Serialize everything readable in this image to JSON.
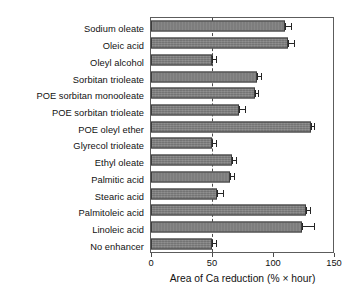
{
  "chart_data": {
    "type": "bar",
    "orientation": "horizontal",
    "title": "",
    "subtitle": "",
    "xlabel": "Area of Ca reduction (% × hour)",
    "ylabel": "",
    "xlim": [
      0,
      150
    ],
    "xticks": [
      0,
      50,
      100,
      150
    ],
    "xticklabels": [
      "0",
      "50",
      "100",
      "150"
    ],
    "grid": false,
    "legend": null,
    "reference_line": {
      "value": 50,
      "style": "dashed",
      "orientation": "vertical"
    },
    "categories": [
      "Sodium oleate",
      "Oleic acid",
      "Oleyl alcohol",
      "Sorbitan trioleate",
      "POE sorbitan monooleate",
      "POE sorbitan trioleate",
      "POE oleyl ether",
      "Glyrecol trioleate",
      "Ethyl oleate",
      "Palmitic acid",
      "Stearic acid",
      "Palmitoleic acid",
      "Linoleic acid",
      "No enhancer"
    ],
    "values": [
      110,
      112,
      50,
      87,
      85,
      72,
      131,
      50,
      66,
      65,
      54,
      127,
      124,
      50
    ],
    "errors": [
      5,
      5,
      3,
      3,
      3,
      5,
      3,
      3,
      4,
      3,
      5,
      3,
      10,
      3
    ],
    "series": [
      {
        "name": "Area of Ca reduction",
        "values": [
          110,
          112,
          50,
          87,
          85,
          72,
          131,
          50,
          66,
          65,
          54,
          127,
          124,
          50
        ],
        "errors": [
          5,
          5,
          3,
          3,
          3,
          5,
          3,
          3,
          4,
          3,
          5,
          3,
          10,
          3
        ]
      }
    ]
  },
  "style": {
    "bar_fill": "#7d7d7d",
    "bar_edge": "#3d3d3d",
    "axis_color": "#5c5c5c",
    "text_color": "#111111",
    "background": "#ffffff"
  }
}
